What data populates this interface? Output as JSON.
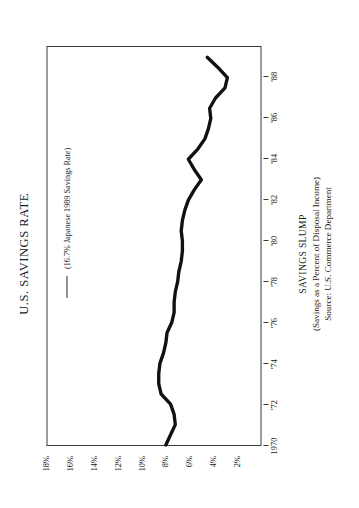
{
  "figure": {
    "title": "U.S. SAVINGS RATE",
    "caption_title": "SAVINGS SLUMP",
    "caption_subtitle": "(Savings as a Percent of Disposal Income)",
    "caption_source": "Source:  U.S. Commerce Department",
    "legend_label": "(16.7% Japanese 1989 Savings Rate)",
    "line_color": "#111111",
    "frame_color": "#3a3a3a"
  },
  "chart_data": {
    "type": "line",
    "title": "U.S. SAVINGS RATE",
    "subtitle": "SAVINGS SLUMP",
    "annotation": "(16.7% Japanese 1989 Savings Rate)",
    "source": "Source:  U.S. Commerce Department",
    "xlabel": "",
    "ylabel": "Savings as a Percent of Disposal Income",
    "xlim": [
      1970,
      1989.5
    ],
    "ylim": [
      0,
      18
    ],
    "grid": false,
    "legend_position": "top-left-inside",
    "x_tick_labels": [
      "1970",
      "'72",
      "'74",
      "'76",
      "'78",
      "'80",
      "'82",
      "'84",
      "'86",
      "'88"
    ],
    "x_tick_values": [
      1970,
      1972,
      1974,
      1976,
      1978,
      1980,
      1982,
      1984,
      1986,
      1988
    ],
    "y_tick_labels": [
      "18%",
      "16%",
      "14%",
      "12%",
      "10%",
      "8%",
      "6%",
      "4%",
      "2%"
    ],
    "y_tick_values": [
      18,
      16,
      14,
      12,
      10,
      8,
      6,
      4,
      2
    ],
    "series": [
      {
        "name": "U.S. Savings Rate",
        "x": [
          1970,
          1970.5,
          1971,
          1971.5,
          1972,
          1972.5,
          1973,
          1973.5,
          1974,
          1974.5,
          1975,
          1975.5,
          1976,
          1976.5,
          1977,
          1977.5,
          1978,
          1978.5,
          1979,
          1979.5,
          1980,
          1980.5,
          1981,
          1981.5,
          1982,
          1982.5,
          1983,
          1983.5,
          1984,
          1984.5,
          1985,
          1985.5,
          1986,
          1986.5,
          1987,
          1987.5,
          1988,
          1988.5,
          1989
        ],
        "values": [
          8.0,
          7.6,
          7.2,
          7.3,
          7.6,
          8.4,
          8.6,
          8.6,
          8.5,
          8.2,
          8.0,
          7.9,
          7.5,
          7.3,
          7.3,
          7.2,
          7.0,
          6.9,
          6.7,
          6.6,
          6.6,
          6.7,
          6.6,
          6.4,
          6.1,
          5.6,
          5.0,
          5.6,
          6.1,
          5.3,
          4.7,
          4.4,
          4.2,
          4.3,
          3.8,
          3.0,
          2.8,
          3.6,
          4.5
        ]
      }
    ]
  }
}
